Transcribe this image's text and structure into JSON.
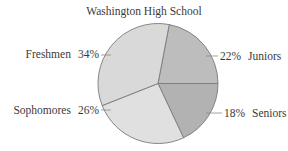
{
  "chart_data": {
    "type": "pie",
    "title": "Washington High School",
    "categories": [
      "Juniors",
      "Seniors",
      "Sophomores",
      "Freshmen"
    ],
    "values": [
      22,
      18,
      26,
      34
    ],
    "unit": "%",
    "slices": [
      {
        "label": "Juniors",
        "value": 22,
        "value_label": "22%",
        "color": "#bdbdbd"
      },
      {
        "label": "Seniors",
        "value": 18,
        "value_label": "18%",
        "color": "#b2b2b2"
      },
      {
        "label": "Sophomores",
        "value": 26,
        "value_label": "26%",
        "color": "#e0e0e0"
      },
      {
        "label": "Freshmen",
        "value": 34,
        "value_label": "34%",
        "color": "#d9d9d9"
      }
    ],
    "start_angle_deg": -79.2,
    "direction": "clockwise",
    "legend": "none",
    "labels_position": "outside with leader lines"
  },
  "labels": {
    "title": "Washington High School",
    "freshmen": {
      "name": "Freshmen",
      "pct": "34%"
    },
    "sophomores": {
      "name": "Sophomores",
      "pct": "26%"
    },
    "juniors": {
      "name": "Juniors",
      "pct": "22%"
    },
    "seniors": {
      "name": "Seniors",
      "pct": "18%"
    }
  },
  "style": {
    "outline_color": "#7a7a7a",
    "leader_color": "#8a8a8a"
  }
}
